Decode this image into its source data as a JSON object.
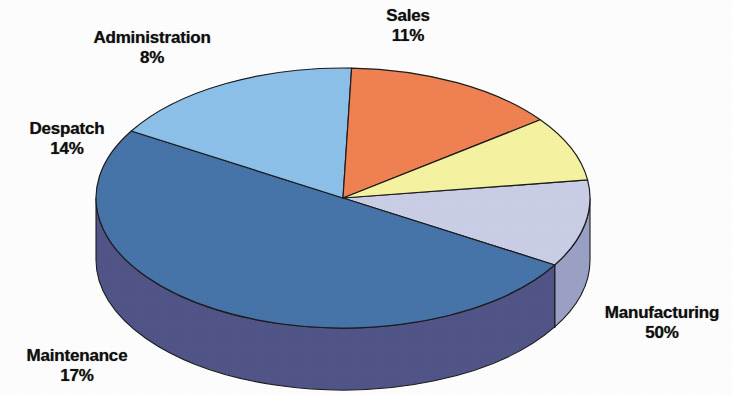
{
  "chart_data": {
    "type": "pie",
    "title": "",
    "subtitle": "",
    "xlabel": "",
    "ylabel": "",
    "style": "3d-pie",
    "legend_position": "none",
    "grid": false,
    "value_unit": "%",
    "label_format": "name + percent",
    "categories": [
      "Sales",
      "Manufacturing",
      "Maintenance",
      "Despatch",
      "Administration"
    ],
    "values": [
      11,
      50,
      17,
      14,
      8
    ],
    "total": 100,
    "slices": [
      {
        "name": "Sales",
        "percent": 11,
        "label_line1": "Sales",
        "label_line2": "11%",
        "color": "#c9cde5",
        "side_color": "#9aa0c4",
        "start_angle_deg": 352,
        "end_angle_deg": 391
      },
      {
        "name": "Manufacturing",
        "percent": 50,
        "label_line1": "Manufacturing",
        "label_line2": "50%",
        "color": "#4573a8",
        "side_color": "#4f5386",
        "start_angle_deg": 31,
        "end_angle_deg": 211
      },
      {
        "name": "Maintenance",
        "percent": 17,
        "label_line1": "Maintenance",
        "label_line2": "17%",
        "color": "#8cc0e8",
        "side_color": "#3f4e5c",
        "start_angle_deg": 211,
        "end_angle_deg": 272
      },
      {
        "name": "Despatch",
        "percent": 14,
        "label_line1": "Despatch",
        "label_line2": "14%",
        "color": "#ef8050",
        "side_color": "#b35a36",
        "start_angle_deg": 272,
        "end_angle_deg": 323
      },
      {
        "name": "Administration",
        "percent": 8,
        "label_line1": "Administration",
        "label_line2": "8%",
        "color": "#f5f2a0",
        "side_color": "#c2bf72",
        "start_angle_deg": 323,
        "end_angle_deg": 352
      }
    ],
    "geometry": {
      "cx": 343,
      "cy": 198,
      "rx": 247,
      "ry": 130,
      "depth": 62
    },
    "colors": {
      "background": "#fdfdfd",
      "outline": "#1a1a1a",
      "text": "#100f0f"
    }
  }
}
